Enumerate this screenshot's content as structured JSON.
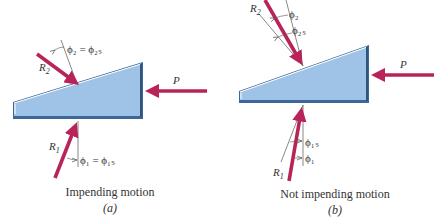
{
  "colors": {
    "force": "#b8245a",
    "wedge_fill": "#9fc3e6",
    "wedge_edge": "#3d6799",
    "wedge_highlight": "#ffffff",
    "line": "#555555",
    "text": "#333333"
  },
  "panel_a": {
    "caption": "Impending motion",
    "sublabel": "(a)",
    "force_p": "P",
    "force_r1": "R",
    "force_r1_sub": "1",
    "force_r2": "R",
    "force_r2_sub": "2",
    "angle_top": "ϕ₂ = ϕ₂ₛ",
    "angle_bottom": "ϕ₁ = ϕ₁ₛ"
  },
  "panel_b": {
    "caption": "Not impending motion",
    "sublabel": "(b)",
    "force_p": "P",
    "force_r1": "R",
    "force_r1_sub": "1",
    "force_r2": "R",
    "force_r2_sub": "2",
    "angle_top_1": "ϕ₂",
    "angle_top_2": "ϕ₂ₛ",
    "angle_bottom_1": "ϕ₁ₛ",
    "angle_bottom_2": "ϕ₁"
  }
}
